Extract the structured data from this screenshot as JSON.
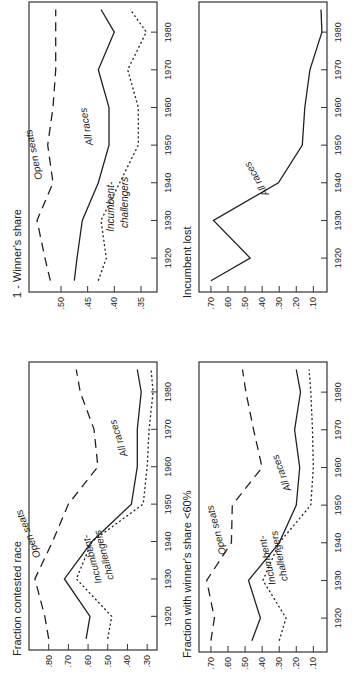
{
  "chart_data": [
    {
      "type": "line",
      "title": "Fraction contested race",
      "x": [
        1914,
        1920,
        1930,
        1940,
        1950,
        1960,
        1970,
        1980,
        1986
      ],
      "xticks": [
        1920,
        1930,
        1940,
        1950,
        1960,
        1970,
        1980
      ],
      "yticks": [
        ".80",
        ".70",
        ".60",
        ".50",
        ".40",
        ".30"
      ],
      "ylim": [
        0.25,
        0.9
      ],
      "series": [
        {
          "name": "Open seats",
          "style": "dashed",
          "values": [
            0.8,
            0.82,
            0.87,
            0.78,
            0.7,
            0.55,
            0.57,
            0.64,
            0.66
          ]
        },
        {
          "name": "All races",
          "style": "solid",
          "values": [
            0.61,
            0.59,
            0.72,
            0.58,
            0.38,
            0.35,
            0.35,
            0.33,
            0.35
          ]
        },
        {
          "name": "Incumbent-challengers",
          "style": "dotted",
          "values": [
            0.5,
            0.48,
            0.66,
            0.58,
            0.32,
            0.3,
            0.29,
            0.27,
            0.28
          ]
        }
      ],
      "annotations": [
        "Open seats",
        "All races",
        "Incumbent-",
        "challengers"
      ]
    },
    {
      "type": "line",
      "title": "1 - Winner's share",
      "x": [
        1914,
        1920,
        1930,
        1940,
        1950,
        1960,
        1970,
        1980,
        1986
      ],
      "xticks": [
        1920,
        1930,
        1940,
        1950,
        1960,
        1970,
        1980
      ],
      "yticks": [
        ".50",
        ".45",
        ".40",
        ".35"
      ],
      "ylim": [
        0.32,
        0.56
      ],
      "series": [
        {
          "name": "Open seats",
          "style": "dashed",
          "values": [
            0.52,
            0.53,
            0.545,
            0.515,
            0.525,
            0.515,
            0.51,
            0.51,
            0.51
          ]
        },
        {
          "name": "All races",
          "style": "solid",
          "values": [
            0.475,
            0.47,
            0.46,
            0.43,
            0.41,
            0.41,
            0.43,
            0.4,
            0.425
          ]
        },
        {
          "name": "Incumbent-challengers",
          "style": "dotted",
          "values": [
            0.43,
            0.415,
            0.425,
            0.39,
            0.355,
            0.355,
            0.375,
            0.34,
            0.37
          ]
        }
      ],
      "annotations": [
        "Open seats",
        "All races",
        "Incumbent-",
        "challengers"
      ]
    },
    {
      "type": "line",
      "title": "Fraction with winner's share <60%",
      "x": [
        1914,
        1920,
        1930,
        1940,
        1950,
        1960,
        1970,
        1980,
        1986
      ],
      "xticks": [
        1920,
        1930,
        1940,
        1950,
        1960,
        1970,
        1980
      ],
      "yticks": [
        ".70",
        ".60",
        ".50",
        ".40",
        ".30",
        ".20",
        ".10"
      ],
      "ylim": [
        0.02,
        0.77
      ],
      "series": [
        {
          "name": "Open seats",
          "style": "dashed",
          "values": [
            0.7,
            0.68,
            0.725,
            0.58,
            0.575,
            0.4,
            0.45,
            0.495,
            0.515
          ]
        },
        {
          "name": "All races",
          "style": "solid",
          "values": [
            0.46,
            0.41,
            0.48,
            0.3,
            0.2,
            0.18,
            0.21,
            0.175,
            0.2
          ]
        },
        {
          "name": "Incumbent-challengers",
          "style": "dotted",
          "values": [
            0.3,
            0.26,
            0.395,
            0.3,
            0.115,
            0.1,
            0.105,
            0.115,
            0.125
          ]
        }
      ],
      "annotations": [
        "Open seats",
        "All races",
        "Incumbent-",
        "challengers"
      ]
    },
    {
      "type": "line",
      "title": "Incumbent lost",
      "x": [
        1914,
        1920,
        1930,
        1940,
        1950,
        1960,
        1970,
        1980,
        1986
      ],
      "xticks": [
        1920,
        1930,
        1940,
        1950,
        1960,
        1970,
        1980
      ],
      "yticks": [
        ".70",
        ".60",
        ".50",
        ".40",
        ".30",
        ".20",
        ".10"
      ],
      "ylim": [
        0.02,
        0.77
      ],
      "series": [
        {
          "name": "All races",
          "style": "solid",
          "values": [
            0.7,
            0.47,
            0.685,
            0.305,
            0.165,
            0.15,
            0.12,
            0.05,
            0.055
          ]
        }
      ],
      "annotations": [
        "All races"
      ]
    }
  ]
}
